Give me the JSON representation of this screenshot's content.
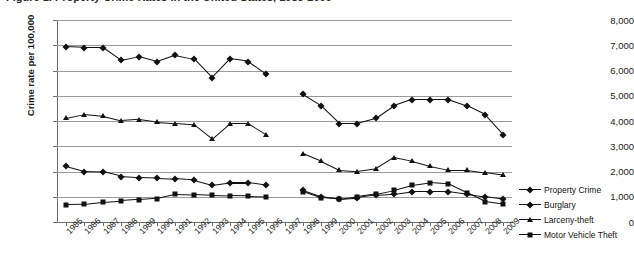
{
  "title": {
    "text": "Figure 1. Property Crime Rates in the United States, 1985-2009",
    "clipped": true
  },
  "axes": {
    "ylabel": "Crime rate per 100,000",
    "xlabel": "",
    "yticks": [
      "0",
      "1,000",
      "2,000",
      "3,000",
      "4,000",
      "5,000",
      "6,000",
      "7,000",
      "8,000"
    ],
    "xticks": [
      "1985",
      "1986",
      "1987",
      "1988",
      "1989",
      "1990",
      "1991",
      "1992",
      "1993",
      "1994",
      "1995",
      "1996",
      "1997",
      "1998",
      "1999",
      "2000",
      "2001",
      "2002",
      "2003",
      "2004",
      "2005",
      "2006",
      "2007",
      "2008",
      "2009"
    ]
  },
  "legend": {
    "position": "right",
    "items": [
      {
        "label": "Property Crime",
        "marker": "diamond",
        "color": "#111111"
      },
      {
        "label": "Burglary",
        "marker": "diamond",
        "color": "#111111"
      },
      {
        "label": "Larceny-theft",
        "marker": "triangle",
        "color": "#111111"
      },
      {
        "label": "Motor Vehicle Theft",
        "marker": "square",
        "color": "#111111"
      }
    ]
  },
  "chart_data": {
    "type": "line",
    "title": "Figure 1. Property Crime Rates in the United States, 1985-2009",
    "xlabel": "",
    "ylabel": "Crime rate per 100,000",
    "ylim": [
      0,
      8000
    ],
    "ytick_step": 1000,
    "grid": true,
    "legend_position": "right",
    "x": [
      "1985",
      "1986",
      "1987",
      "1988",
      "1989",
      "1990",
      "1991",
      "1992",
      "1993",
      "1994",
      "1995",
      "1996",
      "1997",
      "1998",
      "1999",
      "2000",
      "2001",
      "2002",
      "2003",
      "2004",
      "2005",
      "2006",
      "2007",
      "2008",
      "2009"
    ],
    "note": "Series have a data gap at 1997 (no values plotted).",
    "series": [
      {
        "name": "Property Crime",
        "marker": "diamond",
        "color": "#111111",
        "values": [
          6930,
          6900,
          6900,
          6400,
          6550,
          6350,
          6600,
          6450,
          5700,
          6450,
          6350,
          5850,
          null,
          5050,
          4600,
          3900,
          3900,
          4100,
          4600,
          4850,
          4850,
          4850,
          4600,
          4250,
          3450
        ]
      },
      {
        "name": "Burglary",
        "marker": "diamond",
        "color": "#111111",
        "values": [
          2200,
          2000,
          1980,
          1800,
          1750,
          1730,
          1700,
          1650,
          1450,
          1550,
          1550,
          1450,
          null,
          1250,
          1000,
          900,
          950,
          1050,
          1100,
          1200,
          1200,
          1200,
          1100,
          1000,
          900
        ]
      },
      {
        "name": "Larceny-theft",
        "marker": "triangle",
        "color": "#111111",
        "values": [
          4100,
          4250,
          4180,
          4000,
          4050,
          3950,
          3900,
          3850,
          3280,
          3900,
          3900,
          3450,
          null,
          2700,
          2400,
          2050,
          2000,
          2100,
          2550,
          2400,
          2200,
          2050,
          2050,
          1950,
          1850
        ]
      },
      {
        "name": "Motor Vehicle Theft",
        "marker": "square",
        "color": "#111111",
        "values": [
          690,
          700,
          780,
          830,
          880,
          930,
          1100,
          1080,
          1050,
          1030,
          1020,
          1000,
          null,
          1200,
          950,
          900,
          1000,
          1100,
          1250,
          1450,
          1550,
          1500,
          1150,
          800,
          700
        ]
      }
    ]
  }
}
